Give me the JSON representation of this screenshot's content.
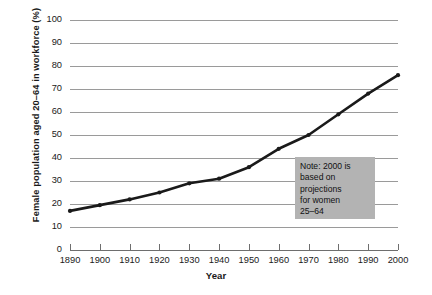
{
  "chart_data": {
    "type": "line",
    "title": "",
    "xlabel": "Year",
    "ylabel": "Female population aged 20–64 in workforce (%)",
    "xlim": [
      1890,
      2000
    ],
    "ylim": [
      0,
      100
    ],
    "grid": "horizontal",
    "legend": "none",
    "x": [
      1890,
      1900,
      1910,
      1920,
      1930,
      1940,
      1950,
      1960,
      1970,
      1980,
      1990,
      2000
    ],
    "xtick_labels": [
      "1890",
      "1900",
      "1910",
      "1920",
      "1930",
      "1940",
      "1950",
      "1960",
      "1970",
      "1980",
      "1990",
      "2000"
    ],
    "ytick_labels": [
      "0",
      "10",
      "20",
      "30",
      "40",
      "50",
      "60",
      "70",
      "80",
      "90",
      "100"
    ],
    "ytick_values": [
      0,
      10,
      20,
      30,
      40,
      50,
      60,
      70,
      80,
      90,
      100
    ],
    "values": [
      17,
      19.5,
      22,
      25,
      29,
      31,
      36,
      44,
      50,
      59,
      68,
      76
    ],
    "series": [
      {
        "name": "Female population aged 20–64 in workforce",
        "values": [
          17,
          19.5,
          22,
          25,
          29,
          31,
          36,
          44,
          50,
          59,
          68,
          76
        ],
        "color": "#1a1a1a",
        "marker": "dot"
      }
    ],
    "annotations": [
      {
        "name": "projection-note",
        "text": "Note: 2000 is based on projections for women 25–64",
        "lines": [
          "Note: 2000 is",
          "based on",
          "projections",
          "for women",
          "25–64"
        ],
        "background": "#b3b3b3",
        "x": 1952,
        "y": 40
      }
    ]
  }
}
